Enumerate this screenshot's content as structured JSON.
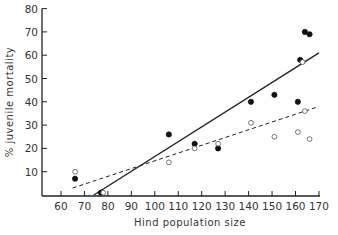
{
  "chart_data": {
    "type": "scatter",
    "title": "",
    "xlabel": "Hind population size",
    "ylabel": "% juvenile mortality",
    "xlim": [
      55,
      172
    ],
    "ylim": [
      0,
      80
    ],
    "x_ticks": [
      60,
      70,
      80,
      90,
      100,
      110,
      120,
      130,
      140,
      150,
      160,
      170
    ],
    "y_ticks": [
      10,
      20,
      30,
      40,
      50,
      60,
      70,
      80
    ],
    "grid": false,
    "legend": null,
    "series": [
      {
        "name": "filled",
        "marker": "filled-circle",
        "points": [
          [
            66,
            7
          ],
          [
            77,
            1
          ],
          [
            106,
            26
          ],
          [
            117,
            22
          ],
          [
            127,
            20
          ],
          [
            141,
            40
          ],
          [
            151,
            43
          ],
          [
            161,
            40
          ],
          [
            162,
            58
          ],
          [
            164,
            70
          ],
          [
            166,
            69
          ]
        ]
      },
      {
        "name": "open",
        "marker": "open-circle",
        "points": [
          [
            66,
            10
          ],
          [
            78,
            1
          ],
          [
            106,
            14
          ],
          [
            117,
            20
          ],
          [
            127,
            22
          ],
          [
            141,
            31
          ],
          [
            151,
            25
          ],
          [
            161,
            27
          ],
          [
            163,
            57
          ],
          [
            164,
            36
          ],
          [
            166,
            24
          ]
        ]
      }
    ],
    "fit_lines": [
      {
        "name": "filled-regression",
        "style": "solid",
        "from": [
          74,
          0
        ],
        "to": [
          170,
          61
        ]
      },
      {
        "name": "open-regression",
        "style": "dashed",
        "from": [
          65,
          3
        ],
        "to": [
          170,
          38
        ]
      }
    ]
  }
}
